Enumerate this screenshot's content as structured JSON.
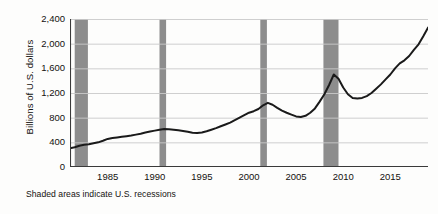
{
  "caption": "Shaded areas indicate U.S. recessions",
  "colors": {
    "line": "#1a1a1a",
    "recession_band": "#8d8d8d",
    "gridline": "#c9c9c9",
    "axis": "#3a3a3a",
    "background": "#fdfdfc",
    "text": "#14110f"
  },
  "chart_data": {
    "type": "line",
    "title": "",
    "subtitle": "",
    "xlabel": "",
    "ylabel": "Billions of U.S. dollars",
    "xlim": [
      1981,
      2019
    ],
    "ylim": [
      0,
      2400
    ],
    "grid": true,
    "legend": false,
    "legend_position": "none",
    "ytick_labels": [
      "0",
      "400",
      "800",
      "1,200",
      "1,600",
      "2,000",
      "2,400"
    ],
    "ytick_values": [
      0,
      400,
      800,
      1200,
      1600,
      2000,
      2400
    ],
    "xtick_labels": [
      "1985",
      "1990",
      "1995",
      "2000",
      "2005",
      "2010",
      "2015"
    ],
    "xtick_values": [
      1985,
      1990,
      1995,
      2000,
      2005,
      2010,
      2015
    ],
    "annotations": [
      "Shaded areas indicate U.S. recessions"
    ],
    "shaded_regions": [
      {
        "label": "1981-82 recession",
        "start": 1981.5,
        "end": 1982.9
      },
      {
        "label": "1990-91 recession",
        "start": 1990.5,
        "end": 1991.2
      },
      {
        "label": "2001 recession",
        "start": 2001.2,
        "end": 2001.9
      },
      {
        "label": "2008-09 recession",
        "start": 2007.9,
        "end": 2009.5
      }
    ],
    "series": [
      {
        "name": "Billions of U.S. dollars",
        "x": [
          1981.0,
          1981.5,
          1982.0,
          1982.5,
          1983.0,
          1983.5,
          1984.0,
          1984.5,
          1985.0,
          1985.5,
          1986.0,
          1986.5,
          1987.0,
          1987.5,
          1988.0,
          1988.5,
          1989.0,
          1989.5,
          1990.0,
          1990.5,
          1991.0,
          1991.5,
          1992.0,
          1992.5,
          1993.0,
          1993.5,
          1994.0,
          1994.5,
          1995.0,
          1995.5,
          1996.0,
          1996.5,
          1997.0,
          1997.5,
          1998.0,
          1998.5,
          1999.0,
          1999.5,
          2000.0,
          2000.5,
          2001.0,
          2001.5,
          2002.0,
          2002.5,
          2003.0,
          2003.5,
          2004.0,
          2004.5,
          2005.0,
          2005.5,
          2006.0,
          2006.5,
          2007.0,
          2007.5,
          2008.0,
          2008.5,
          2009.0,
          2009.5,
          2010.0,
          2010.5,
          2011.0,
          2011.5,
          2012.0,
          2012.5,
          2013.0,
          2013.5,
          2014.0,
          2014.5,
          2015.0,
          2015.5,
          2016.0,
          2016.5,
          2017.0,
          2017.5,
          2018.0,
          2018.5,
          2019.0
        ],
        "y": [
          305,
          320,
          345,
          360,
          370,
          385,
          400,
          425,
          455,
          470,
          480,
          490,
          500,
          510,
          525,
          540,
          560,
          575,
          590,
          605,
          615,
          612,
          605,
          595,
          585,
          570,
          555,
          550,
          560,
          580,
          605,
          630,
          660,
          690,
          720,
          760,
          800,
          840,
          880,
          905,
          940,
          1000,
          1040,
          1010,
          960,
          915,
          880,
          850,
          820,
          810,
          830,
          880,
          950,
          1060,
          1180,
          1330,
          1500,
          1430,
          1290,
          1180,
          1120,
          1110,
          1120,
          1150,
          1200,
          1270,
          1340,
          1420,
          1500,
          1600,
          1680,
          1730,
          1800,
          1900,
          1990,
          2120,
          2260
        ]
      }
    ]
  }
}
